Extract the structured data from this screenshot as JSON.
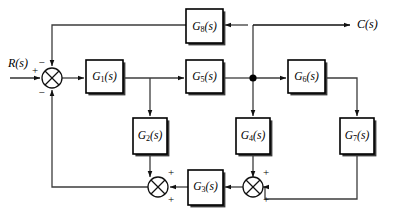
{
  "diagram": {
    "type": "control-system-block-diagram",
    "title": "",
    "corner_mark": "",
    "signals": {
      "input": {
        "name": "R(s)",
        "base": "R",
        "arg": "(s)"
      },
      "output": {
        "name": "C(s)",
        "base": "C",
        "arg": "(s)"
      }
    },
    "blocks": [
      {
        "id": "G8",
        "label": "G8(s)",
        "base": "G",
        "sub": "8",
        "arg": "(s)",
        "x": 186,
        "y": 9,
        "w": 37,
        "h": 34
      },
      {
        "id": "G1",
        "label": "G1(s)",
        "base": "G",
        "sub": "1",
        "arg": "(s)",
        "x": 86,
        "y": 60,
        "w": 37,
        "h": 33
      },
      {
        "id": "G5",
        "label": "G5(s)",
        "base": "G",
        "sub": "5",
        "arg": "(s)",
        "x": 186,
        "y": 60,
        "w": 37,
        "h": 33
      },
      {
        "id": "G6",
        "label": "G6(s)",
        "base": "G",
        "sub": "6",
        "arg": "(s)",
        "x": 288,
        "y": 60,
        "w": 37,
        "h": 33
      },
      {
        "id": "G2",
        "label": "G2(s)",
        "base": "G",
        "sub": "2",
        "arg": "(s)",
        "x": 133,
        "y": 118,
        "w": 34,
        "h": 36
      },
      {
        "id": "G4",
        "label": "G4(s)",
        "base": "G",
        "sub": "4",
        "arg": "(s)",
        "x": 236,
        "y": 118,
        "w": 34,
        "h": 36
      },
      {
        "id": "G7",
        "label": "G7(s)",
        "base": "G",
        "sub": "7",
        "arg": "(s)",
        "x": 340,
        "y": 118,
        "w": 34,
        "h": 36
      },
      {
        "id": "G3",
        "label": "G3(s)",
        "base": "G",
        "sub": "3",
        "arg": "(s)",
        "x": 188,
        "y": 170,
        "w": 35,
        "h": 35
      }
    ],
    "summing_junctions": [
      {
        "id": "sum-left",
        "cx": 52,
        "cy": 78,
        "r": 10,
        "signs": [
          {
            "position": "top",
            "symbol": "−"
          },
          {
            "position": "left",
            "symbol": "+"
          },
          {
            "position": "bottom",
            "symbol": "−"
          }
        ]
      },
      {
        "id": "sum-bottom-left",
        "cx": 158,
        "cy": 187,
        "r": 10,
        "signs": [
          {
            "position": "top-right",
            "symbol": "+"
          },
          {
            "position": "bottom-right",
            "symbol": "+"
          }
        ]
      },
      {
        "id": "sum-bottom-right",
        "cx": 253,
        "cy": 187,
        "r": 10,
        "signs": [
          {
            "position": "top-right",
            "symbol": "+"
          },
          {
            "position": "bottom-right",
            "symbol": "+"
          }
        ]
      }
    ],
    "nodes": [
      {
        "id": "takeoff-c",
        "cx": 253,
        "cy": 76,
        "r": 3.6
      }
    ]
  }
}
